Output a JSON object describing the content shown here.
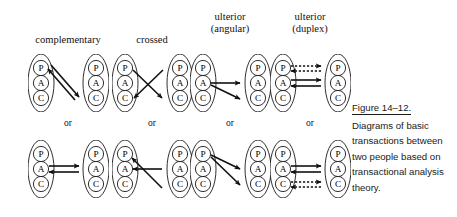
{
  "figure": {
    "columns": [
      {
        "id": "complementary",
        "label_lines": [
          "complementary"
        ],
        "header_cx": 68,
        "header_top": 34,
        "or_label": "or",
        "or_cx": 68,
        "or_top": 118,
        "x": 28
      },
      {
        "id": "crossed",
        "label_lines": [
          "crossed"
        ],
        "header_cx": 152,
        "header_top": 34,
        "or_label": "or",
        "or_cx": 152,
        "or_top": 118,
        "x": 112
      },
      {
        "id": "ulterior-angular",
        "label_lines": [
          "ulterior",
          "(angular)"
        ],
        "header_cx": 230,
        "header_top": 11,
        "or_label": "or",
        "or_cx": 230,
        "or_top": 118,
        "x": 190
      },
      {
        "id": "ulterior-duplex",
        "label_lines": [
          "ulterior",
          "(duplex)"
        ],
        "header_cx": 310,
        "header_top": 11,
        "or_label": "or",
        "or_cx": 310,
        "or_top": 118,
        "x": 270
      }
    ],
    "rows": [
      {
        "id": "top",
        "y": 54
      },
      {
        "id": "bottom",
        "y": 140
      }
    ],
    "ego_states": [
      "P",
      "A",
      "C"
    ],
    "person": {
      "width": 26,
      "height": 58,
      "circle_r": 7.6,
      "circle_cx": 13,
      "circle_cy": [
        14,
        29,
        44
      ],
      "gap_between_people": 29,
      "outline_color": "#1a1a1a",
      "fill_color": "#ffffff"
    },
    "arrow_color": "#111111",
    "transactions": {
      "complementary_top": [
        {
          "from": {
            "person": 1,
            "state": "C"
          },
          "to": {
            "person": 0,
            "state": "P"
          },
          "style": "solid",
          "x1": 47,
          "y1": 46,
          "x2": 20,
          "y2": 15
        },
        {
          "from": {
            "person": 0,
            "state": "P"
          },
          "to": {
            "person": 1,
            "state": "C"
          },
          "style": "solid",
          "x1": 23,
          "y1": 11,
          "x2": 51,
          "y2": 43
        }
      ],
      "complementary_bottom": [
        {
          "from": {
            "person": 0,
            "state": "A"
          },
          "to": {
            "person": 1,
            "state": "A"
          },
          "style": "solid",
          "x1": 21,
          "y1": 26,
          "x2": 51,
          "y2": 26
        },
        {
          "from": {
            "person": 1,
            "state": "A"
          },
          "to": {
            "person": 0,
            "state": "A"
          },
          "style": "solid",
          "x1": 51,
          "y1": 32,
          "x2": 21,
          "y2": 32
        }
      ],
      "crossed_top": [
        {
          "from": {
            "person": 0,
            "state": "P"
          },
          "to": {
            "person": 1,
            "state": "C"
          },
          "style": "solid",
          "x1": 21,
          "y1": 16,
          "x2": 50,
          "y2": 44
        },
        {
          "from": {
            "person": 1,
            "state": "P"
          },
          "to": {
            "person": 0,
            "state": "C"
          },
          "style": "solid",
          "x1": 51,
          "y1": 16,
          "x2": 22,
          "y2": 44
        }
      ],
      "crossed_bottom": [
        {
          "from": {
            "person": 1,
            "state": "C"
          },
          "to": {
            "person": 0,
            "state": "P"
          },
          "style": "solid",
          "x1": 50,
          "y1": 48,
          "x2": 20,
          "y2": 18
        },
        {
          "from": {
            "person": 1,
            "state": "A"
          },
          "to": {
            "person": 0,
            "state": "A"
          },
          "style": "solid",
          "x1": 50,
          "y1": 29,
          "x2": 21,
          "y2": 29
        }
      ],
      "angular_top": [
        {
          "from": {
            "person": 0,
            "state": "A"
          },
          "to": {
            "person": 1,
            "state": "A"
          },
          "style": "solid",
          "x1": 21,
          "y1": 29,
          "x2": 50,
          "y2": 29
        },
        {
          "from": {
            "person": 0,
            "state": "A"
          },
          "to": {
            "person": 1,
            "state": "C"
          },
          "style": "solid",
          "x1": 21,
          "y1": 31,
          "x2": 50,
          "y2": 45
        }
      ],
      "angular_bottom": [
        {
          "from": {
            "person": 0,
            "state": "P"
          },
          "to": {
            "person": 1,
            "state": "A"
          },
          "style": "solid",
          "x1": 21,
          "y1": 15,
          "x2": 50,
          "y2": 29
        },
        {
          "from": {
            "person": 0,
            "state": "P"
          },
          "to": {
            "person": 1,
            "state": "C"
          },
          "style": "solid",
          "x1": 21,
          "y1": 17,
          "x2": 50,
          "y2": 45
        }
      ],
      "duplex_top": [
        {
          "from": {
            "person": 0,
            "state": "P"
          },
          "to": {
            "person": 1,
            "state": "P"
          },
          "style": "dashed",
          "x1": 21,
          "y1": 12,
          "x2": 51,
          "y2": 12
        },
        {
          "from": {
            "person": 1,
            "state": "P"
          },
          "to": {
            "person": 0,
            "state": "P"
          },
          "style": "dashed",
          "x1": 51,
          "y1": 17,
          "x2": 21,
          "y2": 17
        },
        {
          "from": {
            "person": 0,
            "state": "A"
          },
          "to": {
            "person": 1,
            "state": "A"
          },
          "style": "solid",
          "x1": 21,
          "y1": 26,
          "x2": 51,
          "y2": 26
        },
        {
          "from": {
            "person": 1,
            "state": "A"
          },
          "to": {
            "person": 0,
            "state": "A"
          },
          "style": "solid",
          "x1": 51,
          "y1": 32,
          "x2": 21,
          "y2": 32
        }
      ],
      "duplex_bottom": [
        {
          "from": {
            "person": 0,
            "state": "A"
          },
          "to": {
            "person": 1,
            "state": "A"
          },
          "style": "solid",
          "x1": 21,
          "y1": 26,
          "x2": 51,
          "y2": 26
        },
        {
          "from": {
            "person": 1,
            "state": "A"
          },
          "to": {
            "person": 0,
            "state": "A"
          },
          "style": "solid",
          "x1": 51,
          "y1": 32,
          "x2": 21,
          "y2": 32
        },
        {
          "from": {
            "person": 0,
            "state": "C"
          },
          "to": {
            "person": 1,
            "state": "C"
          },
          "style": "dashed",
          "x1": 21,
          "y1": 42,
          "x2": 51,
          "y2": 42
        },
        {
          "from": {
            "person": 1,
            "state": "C"
          },
          "to": {
            "person": 0,
            "state": "C"
          },
          "style": "dashed",
          "x1": 51,
          "y1": 47,
          "x2": 21,
          "y2": 47
        }
      ]
    }
  },
  "caption": {
    "title": "Figure 14–12.",
    "lines": [
      "Diagrams of basic",
      "transactions between",
      "two people based on",
      "transactional analysis",
      "theory."
    ]
  }
}
